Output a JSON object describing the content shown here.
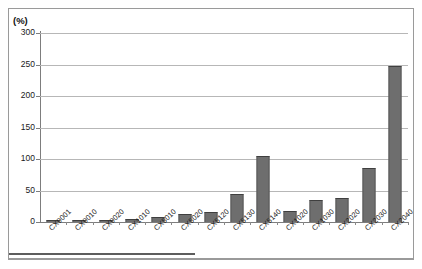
{
  "chart_data": {
    "type": "bar",
    "title": "",
    "subtitle": "",
    "xlabel": "",
    "ylabel": "",
    "unit_label": "(%)",
    "ylim": [
      0,
      300
    ],
    "yticks": [
      0,
      50,
      100,
      150,
      200,
      250,
      300
    ],
    "ytick_labels": [
      "0",
      "50",
      "100",
      "150",
      "200",
      "250",
      "300"
    ],
    "grid": true,
    "legend": false,
    "legend_position": "none",
    "bar_color": "#6e6e6e",
    "gridline_color": "#b7b7b7",
    "axis_color": "#7d7d7d",
    "background_color": "#ffffff",
    "categories": [
      "CX9001",
      "CX9010",
      "CX9020",
      "CX1010",
      "CX5010",
      "CX5020",
      "CX5120",
      "CX5130",
      "CX5140",
      "CX1020",
      "CX1030",
      "CX2020",
      "CX2030",
      "CX2040"
    ],
    "values": [
      1,
      1,
      3,
      4,
      8,
      13,
      16,
      45,
      104,
      17,
      35,
      38,
      86,
      248
    ],
    "series": [
      {
        "name": "",
        "values": [
          1,
          1,
          3,
          4,
          8,
          13,
          16,
          45,
          104,
          17,
          35,
          38,
          86,
          248
        ]
      }
    ]
  }
}
